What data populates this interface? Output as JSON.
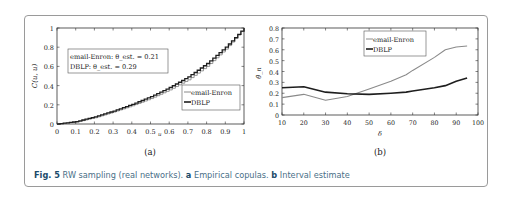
{
  "caption": {
    "fig_label": "Fig. 5",
    "text": "RW sampling (real networks).",
    "a_label": "a",
    "a_text": "Empirical copulas.",
    "b_label": "b",
    "b_text": "Interval estimate"
  },
  "panels": {
    "a": {
      "label": "(a)"
    },
    "b": {
      "label": "(b)"
    }
  },
  "chart_data": [
    {
      "type": "line",
      "panel": "(a)",
      "title": "",
      "xlabel": "u",
      "ylabel": "C(u, u)",
      "xlim": [
        0,
        1
      ],
      "ylim": [
        0,
        1
      ],
      "xticks": [
        "0",
        "0.1",
        "0.2",
        "0.3",
        "0.4",
        "0.5",
        "0.6",
        "0.7",
        "0.8",
        "0.9",
        "1"
      ],
      "yticks": [
        "0",
        "0.2",
        "0.4",
        "0.6",
        "0.8",
        "1"
      ],
      "grid": false,
      "legend_position": "lower right",
      "annotation": [
        "email-Enron: θ_est. = 0.21",
        "DBLP: θ_est. = 0.29"
      ],
      "x": [
        0,
        0.1,
        0.2,
        0.3,
        0.4,
        0.5,
        0.6,
        0.7,
        0.8,
        0.9,
        1.0
      ],
      "series": [
        {
          "name": "email-Enron",
          "values": [
            0,
            0.02,
            0.065,
            0.125,
            0.19,
            0.265,
            0.355,
            0.46,
            0.6,
            0.78,
            1.0
          ]
        },
        {
          "name": "DBLP",
          "values": [
            0,
            0.025,
            0.075,
            0.135,
            0.205,
            0.285,
            0.38,
            0.49,
            0.63,
            0.8,
            1.0
          ]
        }
      ]
    },
    {
      "type": "line",
      "panel": "(b)",
      "title": "",
      "xlabel": "δ",
      "ylabel": "θ̂_n",
      "xlim": [
        10,
        100
      ],
      "ylim": [
        0,
        0.8
      ],
      "xticks": [
        "10",
        "20",
        "30",
        "40",
        "50",
        "60",
        "70",
        "80",
        "90",
        "100"
      ],
      "yticks": [
        "0",
        "0.1",
        "0.2",
        "0.3",
        "0.4",
        "0.5",
        "0.6",
        "0.7",
        "0.8"
      ],
      "grid": false,
      "legend_position": "upper center",
      "x": [
        10,
        20,
        30,
        40,
        50,
        60,
        67,
        70,
        80,
        85,
        90,
        95
      ],
      "series": [
        {
          "name": "email-Enron",
          "values": [
            0.16,
            0.19,
            0.135,
            0.17,
            0.24,
            0.31,
            0.37,
            0.41,
            0.53,
            0.6,
            0.625,
            0.635
          ]
        },
        {
          "name": "DBLP",
          "values": [
            0.25,
            0.26,
            0.21,
            0.195,
            0.19,
            0.2,
            0.21,
            0.22,
            0.25,
            0.27,
            0.31,
            0.34
          ]
        }
      ]
    }
  ]
}
